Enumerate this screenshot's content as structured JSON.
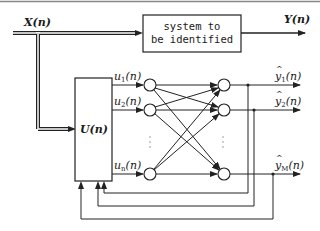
{
  "diagram": {
    "input_signal": "X(n)",
    "output_signal": "Y(n)",
    "system_block": {
      "line1": "system to",
      "line2": "be identified"
    },
    "transform_block": "U(n)",
    "inputs": [
      {
        "var": "u",
        "sub": "1",
        "arg": "(n)"
      },
      {
        "var": "u",
        "sub": "2",
        "arg": "(n)"
      },
      {
        "var": "u",
        "sub": "n",
        "subsub": "x",
        "arg": "(n)"
      }
    ],
    "outputs": [
      {
        "var": "y",
        "sub": "1",
        "arg": "(n)"
      },
      {
        "var": "y",
        "sub": "2",
        "arg": "(n)"
      },
      {
        "var": "y",
        "sub": "M",
        "arg": "(n)"
      }
    ],
    "ellipsis": "⋮",
    "colors": {
      "line": "#222222",
      "double_line_fill": "#ffffff",
      "top_rule": "#888888"
    }
  }
}
